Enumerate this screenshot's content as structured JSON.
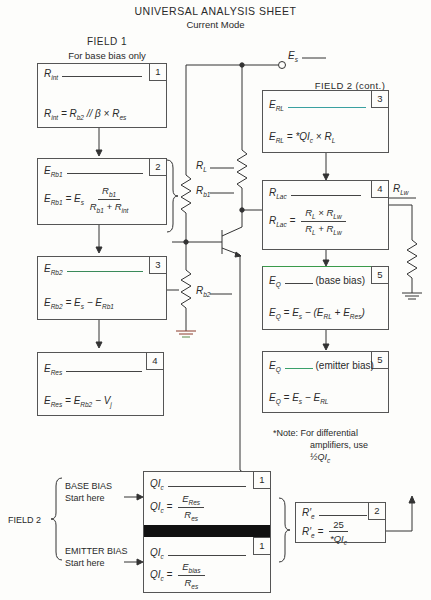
{
  "header": {
    "title": "UNIVERSAL ANALYSIS SHEET",
    "subtitle": "Current Mode"
  },
  "field1": {
    "heading": "FIELD 1",
    "subheading": "For base bias only",
    "boxes": [
      {
        "num": "1",
        "label": "R",
        "label_sub": "int",
        "formula": "R_int = R_b2 // β × R_es"
      },
      {
        "num": "2",
        "label": "E",
        "label_sub": "Rb1",
        "formula_lhs": "E_Rb1 = E_s",
        "numerator": "R_b1",
        "denominator": "R_b1 + R_int"
      },
      {
        "num": "3",
        "label": "E",
        "label_sub": "Rb2",
        "formula": "E_Rb2 = E_s − E_Rb1"
      },
      {
        "num": "4",
        "label": "E",
        "label_sub": "Res",
        "formula": "E_Res = E_Rb2 − V_j"
      }
    ]
  },
  "field2cont": {
    "heading": "FIELD 2 (cont.)",
    "boxes": [
      {
        "num": "3",
        "label": "E",
        "label_sub": "RL",
        "formula": "E_RL = *QI_c × R_L"
      },
      {
        "num": "4",
        "label": "R",
        "label_sub": "Lac",
        "formula_lhs": "R_Lac =",
        "numerator": "R_L × R_Lw",
        "denominator": "R_L + R_Lw"
      },
      {
        "num": "5",
        "label": "E",
        "label_sub": "Q",
        "suffix": "(base bias)",
        "formula": "E_Q = E_s − (E_RL + E_Res)"
      },
      {
        "num": "5",
        "label": "E",
        "label_sub": "Q",
        "suffix": "(emitter bias)",
        "formula": "E_Q = E_s − E_RL"
      }
    ]
  },
  "circuit": {
    "source_label": "E_s",
    "load_label": "R_L",
    "rb1_label": "R_b1",
    "rb2_label": "R_b2",
    "res_label": "R_es",
    "rlw_label": "R_Lw"
  },
  "note": {
    "line1": "*Note:  For differential",
    "line2": "amplifiers, use",
    "line3": "½QI_c"
  },
  "field2": {
    "heading": "FIELD 2",
    "base_bias": {
      "title": "BASE BIAS",
      "hint": "Start here"
    },
    "emitter_bias": {
      "title": "EMITTER BIAS",
      "hint": "Start here"
    },
    "box1_top": {
      "num": "1",
      "label": "QI_c",
      "formula_lhs": "QI_c =",
      "numerator": "E_Res",
      "denominator": "R_es"
    },
    "box1_bottom": {
      "num": "1",
      "label": "QI_c",
      "formula_lhs": "QI_c =",
      "numerator": "E_bias",
      "denominator": "R_es"
    },
    "box2": {
      "num": "2",
      "label": "R′_e",
      "formula_lhs": "R′_e =",
      "numerator": "25",
      "denominator": "*QI_c"
    }
  }
}
